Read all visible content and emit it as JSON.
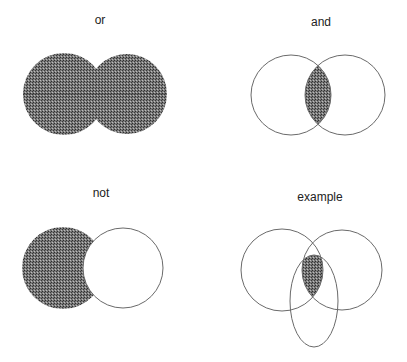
{
  "diagrams": [
    {
      "id": "or",
      "label": "or",
      "label_pos": [
        100,
        24
      ],
      "shapes": [
        {
          "type": "circle",
          "cx": 64,
          "cy": 94,
          "r": 41
        },
        {
          "type": "circle",
          "cx": 127,
          "cy": 94,
          "r": 40
        }
      ],
      "shaded": "union"
    },
    {
      "id": "and",
      "label": "and",
      "label_pos": [
        321,
        26
      ],
      "shapes": [
        {
          "type": "circle",
          "cx": 291,
          "cy": 95,
          "r": 40
        },
        {
          "type": "circle",
          "cx": 345,
          "cy": 95,
          "r": 40
        }
      ],
      "shaded": "intersection"
    },
    {
      "id": "not",
      "label": "not",
      "label_pos": [
        101,
        197
      ],
      "shapes": [
        {
          "type": "circle",
          "cx": 63,
          "cy": 268,
          "r": 41
        },
        {
          "type": "circle",
          "cx": 123,
          "cy": 268,
          "r": 40
        }
      ],
      "shaded": "first-minus-second"
    },
    {
      "id": "example",
      "label": "example",
      "label_pos": [
        320,
        201
      ],
      "shapes": [
        {
          "type": "circle",
          "cx": 282,
          "cy": 270,
          "r": 41
        },
        {
          "type": "circle",
          "cx": 342,
          "cy": 270,
          "r": 40
        },
        {
          "type": "ellipse",
          "cx": 314,
          "cy": 301,
          "rx": 24,
          "ry": 46
        }
      ],
      "shaded": "intersection-of-all"
    }
  ],
  "colors": {
    "fill": "#5a5a5a",
    "outline": "#6a6a6a",
    "text": "#222222",
    "background": "#ffffff"
  }
}
